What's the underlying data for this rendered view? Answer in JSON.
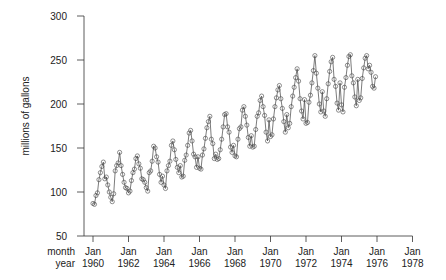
{
  "chart_data": {
    "type": "line",
    "title": "",
    "xlabel_rows": [
      "month",
      "year"
    ],
    "ylabel": "millions of gallons",
    "ylim": [
      50,
      300
    ],
    "yticks": [
      50,
      100,
      150,
      200,
      250,
      300
    ],
    "xticks": [
      {
        "month": "Jan",
        "year": "1960"
      },
      {
        "month": "Jan",
        "year": "1962"
      },
      {
        "month": "Jan",
        "year": "1964"
      },
      {
        "month": "Jan",
        "year": "1966"
      },
      {
        "month": "Jan",
        "year": "1968"
      },
      {
        "month": "Jan",
        "year": "1970"
      },
      {
        "month": "Jan",
        "year": "1972"
      },
      {
        "month": "Jan",
        "year": "1974"
      },
      {
        "month": "Jan",
        "year": "1976"
      },
      {
        "month": "Jan",
        "year": "1978"
      }
    ],
    "x_start": "Jan 1960",
    "x_end": "Dec 1975",
    "marker": "open-circle",
    "series": [
      {
        "name": "monthly gasoline demand",
        "values": [
          87,
          86,
          96,
          99,
          114,
          122,
          129,
          134,
          115,
          117,
          108,
          100,
          94,
          89,
          98,
          124,
          130,
          133,
          145,
          130,
          120,
          111,
          105,
          104,
          99,
          101,
          113,
          122,
          126,
          138,
          141,
          132,
          127,
          115,
          114,
          111,
          105,
          101,
          122,
          124,
          135,
          152,
          150,
          140,
          134,
          120,
          111,
          118,
          108,
          104,
          124,
          130,
          135,
          153,
          158,
          148,
          137,
          128,
          122,
          130,
          117,
          118,
          136,
          142,
          153,
          167,
          170,
          158,
          143,
          140,
          128,
          140,
          127,
          126,
          142,
          149,
          161,
          173,
          180,
          186,
          160,
          155,
          138,
          143,
          137,
          138,
          148,
          160,
          174,
          188,
          189,
          174,
          168,
          151,
          145,
          153,
          141,
          140,
          160,
          172,
          174,
          193,
          197,
          186,
          176,
          162,
          152,
          164,
          151,
          152,
          171,
          186,
          190,
          204,
          209,
          197,
          187,
          168,
          158,
          182,
          163,
          165,
          183,
          197,
          207,
          216,
          221,
          206,
          195,
          180,
          168,
          188,
          173,
          178,
          197,
          209,
          219,
          230,
          240,
          226,
          206,
          192,
          183,
          205,
          178,
          179,
          202,
          210,
          224,
          238,
          255,
          235,
          218,
          200,
          191,
          214,
          192,
          186,
          206,
          223,
          237,
          248,
          253,
          228,
          220,
          201,
          193,
          224,
          199,
          191,
          219,
          230,
          244,
          254,
          256,
          232,
          224,
          208,
          198,
          228,
          204,
          207,
          229,
          241,
          252,
          255,
          240,
          244,
          236,
          220,
          218,
          231
        ]
      }
    ],
    "grid": false,
    "legend": null
  }
}
